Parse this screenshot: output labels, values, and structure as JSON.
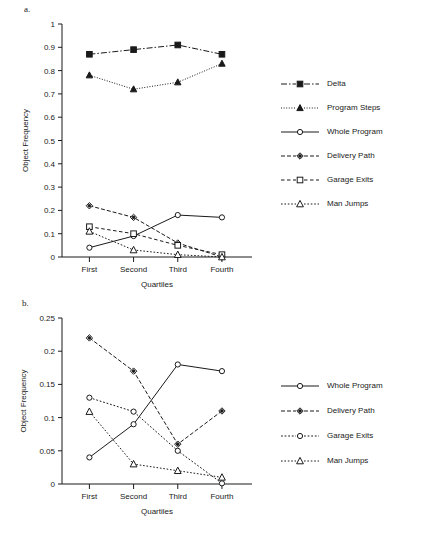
{
  "figure": {
    "panel_a_label": "a.",
    "panel_b_label": "b."
  },
  "chart_data": [
    {
      "type": "line",
      "panel": "a.",
      "title": "",
      "xlabel": "Quartiles",
      "ylabel": "Object Frequency",
      "categories": [
        "First",
        "Second",
        "Third",
        "Fourth"
      ],
      "ylim": [
        0,
        1
      ],
      "yticks": [
        0,
        0.1,
        0.2,
        0.3,
        0.4,
        0.5,
        0.6,
        0.7,
        0.8,
        0.9,
        1
      ],
      "ytick_labels": [
        "0",
        "0.1",
        "0.2",
        "0.3",
        "0.4",
        "0.5",
        "0.6",
        "0.7",
        "0.8",
        "0.9",
        "1"
      ],
      "grid": false,
      "legend_position": "right",
      "series": [
        {
          "name": "Delta",
          "values": [
            0.87,
            0.89,
            0.91,
            0.87
          ],
          "marker": "square-filled",
          "dash": "6,2,1.5,2"
        },
        {
          "name": "Program Steps",
          "values": [
            0.78,
            0.72,
            0.75,
            0.83
          ],
          "marker": "triangle-filled",
          "dash": "1,1.6"
        },
        {
          "name": "Whole Program",
          "values": [
            0.04,
            0.09,
            0.18,
            0.17
          ],
          "marker": "circle-open",
          "dash": "none"
        },
        {
          "name": "Delivery Path",
          "values": [
            0.22,
            0.17,
            0.06,
            0.0
          ],
          "marker": "diamond-filled",
          "dash": "4,2"
        },
        {
          "name": "Garage Exits",
          "values": [
            0.13,
            0.1,
            0.05,
            0.01
          ],
          "marker": "square-open",
          "dash": "3.5,2.5"
        },
        {
          "name": "Man Jumps",
          "values": [
            0.11,
            0.03,
            0.01,
            0.0
          ],
          "marker": "triangle-open",
          "dash": "1.6,1.8"
        }
      ]
    },
    {
      "type": "line",
      "panel": "b.",
      "title": "",
      "xlabel": "Quartiles",
      "ylabel": "Object Frequency",
      "categories": [
        "First",
        "Second",
        "Third",
        "Fourth"
      ],
      "ylim": [
        0,
        0.25
      ],
      "yticks": [
        0,
        0.05,
        0.1,
        0.15,
        0.2,
        0.25
      ],
      "ytick_labels": [
        "0",
        "0.05",
        "0.1",
        "0.15",
        "0.2",
        "0.25"
      ],
      "grid": false,
      "legend_position": "right",
      "series": [
        {
          "name": "Whole Program",
          "values": [
            0.04,
            0.09,
            0.18,
            0.17
          ],
          "marker": "circle-open",
          "dash": "none"
        },
        {
          "name": "Delivery Path",
          "values": [
            0.22,
            0.17,
            0.06,
            0.11
          ],
          "marker": "diamond-filled",
          "dash": "4,2"
        },
        {
          "name": "Garage Exits",
          "values": [
            0.13,
            0.109,
            0.05,
            0.001
          ],
          "marker": "circle-open",
          "dash": "1.8,1.8"
        },
        {
          "name": "Man Jumps",
          "values": [
            0.109,
            0.03,
            0.02,
            0.01
          ],
          "marker": "triangle-open",
          "dash": "1.6,1.8"
        }
      ]
    }
  ]
}
